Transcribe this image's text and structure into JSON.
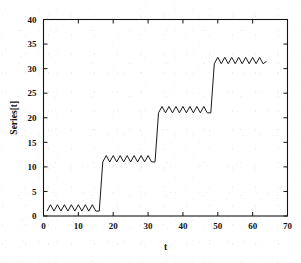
{
  "chart_data": {
    "type": "line",
    "title": "",
    "xlabel": "t",
    "ylabel": "Series[t]",
    "xlim": [
      0,
      70
    ],
    "ylim": [
      0,
      40
    ],
    "xticks": [
      0,
      10,
      20,
      30,
      40,
      50,
      60,
      70
    ],
    "yticks": [
      0,
      5,
      10,
      15,
      20,
      25,
      30,
      35,
      40
    ],
    "xtick_labels": [
      "0",
      "10",
      "20",
      "30",
      "40",
      "50",
      "60",
      "70"
    ],
    "ytick_labels": [
      "0",
      "5",
      "10",
      "15",
      "20",
      "25",
      "30",
      "35",
      "40"
    ],
    "grid": false,
    "legend": null,
    "line_color": "#1a1a1a",
    "line_width": 1.0,
    "background_color": "#ffffff",
    "plateaus": [
      {
        "level": 1.5,
        "t_start": 1,
        "t_end": 16,
        "amplitude": 0.8
      },
      {
        "level": 11.5,
        "t_start": 17,
        "t_end": 31,
        "amplitude": 0.8
      },
      {
        "level": 21.5,
        "t_start": 33,
        "t_end": 47,
        "amplitude": 0.8
      },
      {
        "level": 31.5,
        "t_start": 49,
        "t_end": 64,
        "amplitude": 0.8
      }
    ],
    "x": [
      1,
      2,
      3,
      4,
      5,
      6,
      7,
      8,
      9,
      10,
      11,
      12,
      13,
      14,
      15,
      16,
      17,
      18,
      19,
      20,
      21,
      22,
      23,
      24,
      25,
      26,
      27,
      28,
      29,
      30,
      31,
      32,
      33,
      34,
      35,
      36,
      37,
      38,
      39,
      40,
      41,
      42,
      43,
      44,
      45,
      46,
      47,
      48,
      49,
      50,
      51,
      52,
      53,
      54,
      55,
      56,
      57,
      58,
      59,
      60,
      61,
      62,
      63,
      64
    ],
    "y": [
      1.0,
      2.3,
      1.0,
      2.3,
      1.0,
      2.3,
      1.0,
      2.3,
      1.0,
      2.3,
      1.0,
      2.3,
      1.0,
      2.3,
      1.0,
      1.0,
      11.0,
      12.3,
      11.0,
      12.3,
      11.0,
      12.3,
      11.0,
      12.3,
      11.0,
      12.3,
      11.0,
      12.3,
      11.0,
      12.3,
      11.0,
      11.0,
      21.0,
      22.3,
      21.0,
      22.3,
      21.0,
      22.3,
      21.0,
      22.3,
      21.0,
      22.3,
      21.0,
      22.3,
      21.0,
      22.3,
      21.0,
      21.0,
      31.0,
      32.3,
      31.0,
      32.3,
      31.0,
      32.3,
      31.0,
      32.3,
      31.0,
      32.3,
      31.0,
      32.3,
      31.0,
      32.3,
      31.0,
      31.5
    ]
  },
  "axes": {
    "x_axis_label": "t",
    "y_axis_label": "Series[t]"
  }
}
